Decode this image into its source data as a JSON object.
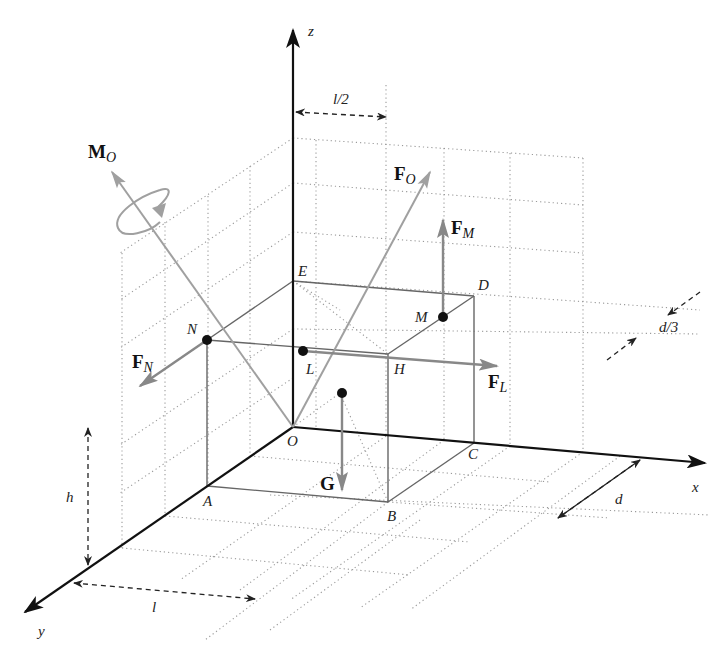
{
  "diagram": {
    "axes": {
      "x": "x",
      "y": "y",
      "z": "z",
      "origin": "O"
    },
    "points": {
      "A": "A",
      "B": "B",
      "C": "C",
      "D": "D",
      "E": "E",
      "H": "H",
      "L": "L",
      "M": "M",
      "N": "N"
    },
    "vectors": {
      "MO": {
        "main": "M",
        "sub": "O"
      },
      "FO": {
        "main": "F",
        "sub": "O"
      },
      "FM": {
        "main": "F",
        "sub": "M"
      },
      "FN": {
        "main": "F",
        "sub": "N"
      },
      "FL": {
        "main": "F",
        "sub": "L"
      },
      "G": {
        "main": "G",
        "sub": ""
      }
    },
    "dimensions": {
      "half_length": "l/2",
      "length": "l",
      "height": "h",
      "depth": "d",
      "third_depth": "d/3"
    },
    "colors": {
      "axis": "#111111",
      "box_edge": "#666666",
      "force": "#8a8a8a",
      "grid": "#9a9a9a",
      "point": "#111111",
      "dimension": "#222222"
    }
  }
}
